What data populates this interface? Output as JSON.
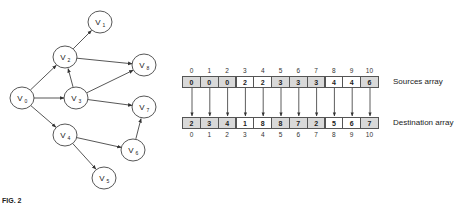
{
  "graph": {
    "nodes": [
      {
        "id": "V0",
        "label": "V",
        "sub": "0",
        "x": 22,
        "y": 98
      },
      {
        "id": "V1",
        "label": "V",
        "sub": "1",
        "x": 100,
        "y": 22
      },
      {
        "id": "V2",
        "label": "V",
        "sub": "2",
        "x": 65,
        "y": 57
      },
      {
        "id": "V3",
        "label": "V",
        "sub": "3",
        "x": 76,
        "y": 98
      },
      {
        "id": "V4",
        "label": "V",
        "sub": "4",
        "x": 65,
        "y": 135
      },
      {
        "id": "V5",
        "label": "V",
        "sub": "5",
        "x": 104,
        "y": 178
      },
      {
        "id": "V6",
        "label": "V",
        "sub": "6",
        "x": 133,
        "y": 150
      },
      {
        "id": "V7",
        "label": "V",
        "sub": "7",
        "x": 144,
        "y": 107
      },
      {
        "id": "V8",
        "label": "V",
        "sub": "8",
        "x": 144,
        "y": 65
      }
    ],
    "edges": [
      [
        "V0",
        "V2"
      ],
      [
        "V0",
        "V3"
      ],
      [
        "V0",
        "V4"
      ],
      [
        "V2",
        "V1"
      ],
      [
        "V2",
        "V8"
      ],
      [
        "V3",
        "V2"
      ],
      [
        "V3",
        "V8"
      ],
      [
        "V3",
        "V7"
      ],
      [
        "V4",
        "V6"
      ],
      [
        "V4",
        "V5"
      ],
      [
        "V6",
        "V7"
      ]
    ],
    "node_radius": 11.5
  },
  "sources_array": {
    "label": "Sources array",
    "indices": [
      "0",
      "1",
      "2",
      "3",
      "4",
      "5",
      "6",
      "7",
      "8",
      "9",
      "10"
    ],
    "values": [
      "0",
      "0",
      "0",
      "2",
      "2",
      "3",
      "3",
      "3",
      "4",
      "4",
      "6"
    ],
    "shading": [
      "gray",
      "gray",
      "gray",
      "white",
      "white",
      "gray",
      "gray",
      "gray",
      "white",
      "white",
      "gray"
    ]
  },
  "destination_array": {
    "label": "Destination array",
    "indices": [
      "0",
      "1",
      "2",
      "3",
      "4",
      "5",
      "6",
      "7",
      "8",
      "9",
      "10"
    ],
    "values": [
      "2",
      "3",
      "4",
      "1",
      "8",
      "8",
      "7",
      "2",
      "5",
      "6",
      "7"
    ],
    "shading": [
      "gray",
      "gray",
      "gray",
      "white",
      "white",
      "gray",
      "gray",
      "gray",
      "white",
      "white",
      "gray"
    ]
  },
  "caption": "FIG. 2",
  "colors": {
    "stroke": "#444444",
    "cell_gray": "#d9d9d9",
    "cell_white": "#ffffff"
  }
}
